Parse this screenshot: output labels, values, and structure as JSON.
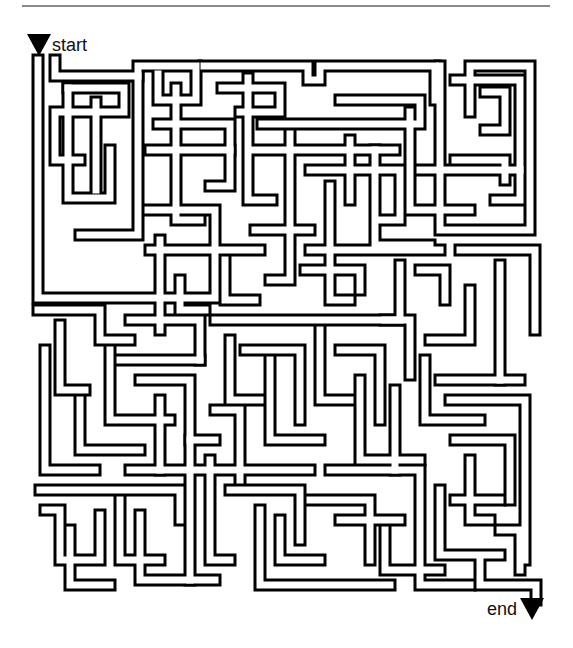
{
  "page": {
    "colors": {
      "wall": "#000000",
      "corridor": "#ffffff",
      "rule": "#8a8a8a"
    }
  },
  "markers": {
    "start": {
      "label": "start",
      "icon": "down-triangle-icon"
    },
    "end": {
      "label": "end",
      "icon": "down-triangle-icon"
    }
  },
  "maze": {
    "bounds": {
      "x": 32,
      "y": 63,
      "width": 509,
      "height": 527
    },
    "corridor_outer": 13,
    "corridor_inner": 7,
    "paths": [
      "M38,60 L38,298 L215,298 L215,210 L148,210",
      "M55,60 L55,76 L138,76 L138,235 L80,235",
      "M68,88 L124,88 L124,112 L55,112 L55,160 L80,160",
      "M68,88 L68,198 L110,198 L110,150",
      "M96,102 L96,190",
      "M138,76 L138,66 L196,66 L196,100 L158,100 L158,74",
      "M158,124 L230,124 L230,186 L210,186",
      "M150,150 L230,150",
      "M176,88 L176,220 L200,220",
      "M204,66 L308,66 L308,80 L320,80 L320,66 L435,66 L435,100",
      "M222,88 L280,88 L280,112 L240,112",
      "M248,78 L248,200 L272,200",
      "M250,150 L395,150",
      "M262,124 L420,124 L420,100 L340,100",
      "M290,134 L290,280 L270,280",
      "M310,170 L400,170 L400,220 L380,220",
      "M330,186 L330,300 L350,300",
      "M350,140 L350,200",
      "M375,150 L375,245 L430,245",
      "M410,112 L410,210 L470,210",
      "M440,66 L440,230 L530,230 L530,66 L470,66 L470,112",
      "M455,80 L520,80 L520,200 L495,200",
      "M485,92 L505,92 L505,130 L485,130",
      "M455,160 L505,160 L505,180",
      "M420,170 L520,170",
      "M460,250 L535,250 L535,330",
      "M500,265 L500,380 L520,380",
      "M470,290 L470,340 L430,340",
      "M150,250 L260,250",
      "M160,240 L160,330",
      "M180,280 L180,310 L205,310",
      "M225,260 L225,300 L255,300",
      "M255,230 L310,230",
      "M310,250 L440,250",
      "M305,270 L360,270 L360,290",
      "M400,265 L400,320 L385,320",
      "M420,270 L445,270 L445,300",
      "M38,310 L100,310 L100,340 L130,340",
      "M60,325 L60,390 L85,390",
      "M45,350 L45,470 L95,470",
      "M110,350 L110,420 L170,420",
      "M80,400 L80,450 L140,450",
      "M130,320 L200,320 L200,360",
      "M120,360 L200,360",
      "M215,320 L410,320 L410,375",
      "M230,340 L230,400 L260,400",
      "M245,350 L300,350 L300,420",
      "M270,360 L270,440 L320,440",
      "M320,330 L320,400 L350,400",
      "M340,350 L380,350 L380,420",
      "M360,380 L360,460 L420,460",
      "M395,390 L395,470",
      "M425,360 L425,420 L480,420",
      "M440,380 L500,380",
      "M450,400 L525,400 L525,560",
      "M455,440 L510,440 L510,500",
      "M470,460 L470,520 L490,520",
      "M140,380 L190,380 L190,440 L215,440",
      "M160,400 L160,470",
      "M215,410 L240,410 L240,480",
      "M130,470 L310,470",
      "M40,490 L180,490 L180,520",
      "M45,510 L60,510 L60,560 L100,560 L100,515",
      "M70,530 L70,585 L110,585",
      "M120,500 L120,560 L160,560",
      "M140,515 L140,580 L215,580",
      "M190,440 L190,580",
      "M210,460 L210,560 L230,560",
      "M230,490 L300,490 L300,540",
      "M260,510 L260,585 L390,585",
      "M280,520 L280,560 L320,560",
      "M310,500 L370,500 L370,560",
      "M330,470 L420,470 L420,585 L470,585",
      "M340,520 L400,520",
      "M385,530 L385,570 L440,570",
      "M440,490 L440,555 L500,555",
      "M455,500 L500,500",
      "M480,560 L480,585 L536,585 L536,600",
      "M500,530 L520,530 L520,570"
    ]
  }
}
